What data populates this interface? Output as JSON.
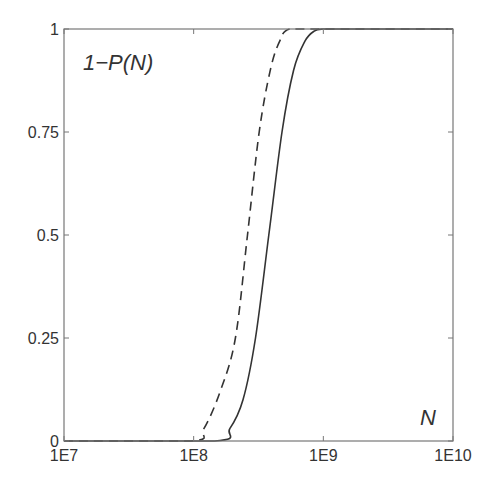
{
  "chart_data": {
    "type": "line",
    "title": "",
    "xlabel": "N",
    "ylabel": "1-P(N)",
    "xscale": "log",
    "xlim": [
      10000000.0,
      10000000000.0
    ],
    "ylim": [
      0,
      1
    ],
    "grid": false,
    "legend": null,
    "x_ticks": [
      {
        "value": 10000000.0,
        "label": "1E7"
      },
      {
        "value": 100000000.0,
        "label": "1E8"
      },
      {
        "value": 1000000000.0,
        "label": "1E9"
      },
      {
        "value": 10000000000.0,
        "label": "1E10"
      }
    ],
    "y_ticks": [
      {
        "value": 0,
        "label": "0"
      },
      {
        "value": 0.25,
        "label": "0.25"
      },
      {
        "value": 0.5,
        "label": "0.5"
      },
      {
        "value": 0.75,
        "label": "0.75"
      },
      {
        "value": 1,
        "label": "1"
      }
    ],
    "annotations": [
      {
        "text": "1−P(N)",
        "position": "top-left"
      },
      {
        "text": "N",
        "position": "bottom-right"
      }
    ],
    "series": [
      {
        "name": "dashed",
        "style": "dashed",
        "color": "#333333",
        "x": [
          10000000.0,
          95000000.0,
          120000000.0,
          160000000.0,
          210000000.0,
          260000000.0,
          320000000.0,
          390000000.0,
          460000000.0,
          550000000.0,
          1000000000.0,
          10000000000.0
        ],
        "y": [
          0,
          0,
          0.03,
          0.12,
          0.25,
          0.5,
          0.75,
          0.9,
          0.97,
          1.0,
          1.0,
          1.0
        ]
      },
      {
        "name": "solid",
        "style": "solid",
        "color": "#333333",
        "x": [
          10000000.0,
          145000000.0,
          190000000.0,
          240000000.0,
          300000000.0,
          380000000.0,
          480000000.0,
          590000000.0,
          720000000.0,
          850000000.0,
          1000000000.0,
          1250000000.0,
          10000000000.0
        ],
        "y": [
          0,
          0,
          0.03,
          0.1,
          0.25,
          0.5,
          0.75,
          0.9,
          0.97,
          0.995,
          1.0,
          1.0,
          1.0
        ]
      }
    ]
  },
  "layout": {
    "plot_box": {
      "left": 64,
      "top": 29,
      "right": 453,
      "bottom": 441
    },
    "axis_color": "#777777",
    "line_color": "#333333"
  }
}
